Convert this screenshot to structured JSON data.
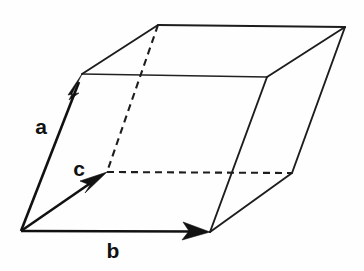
{
  "figure": {
    "title": "Crystallographic unit cell parallelepiped",
    "background_color": "#fefefe",
    "line_color": "#1d1d1d",
    "vector_color": "#111111",
    "canvas": {
      "width": 364,
      "height": 271
    }
  },
  "vectors": [
    {
      "id": "a",
      "label": "a",
      "label_x": 41,
      "label_y": 128,
      "from": {
        "x": 21,
        "y": 231
      },
      "to": {
        "x": 82,
        "y": 74
      },
      "style": "solid-arrow",
      "description": "lattice vector a, up and slightly right"
    },
    {
      "id": "b",
      "label": "b",
      "label_x": 113,
      "label_y": 252,
      "from": {
        "x": 21,
        "y": 231
      },
      "to": {
        "x": 210,
        "y": 232
      },
      "style": "solid-arrow",
      "description": "lattice vector b, horizontal to the right"
    },
    {
      "id": "c",
      "label": "c",
      "label_x": 79,
      "label_y": 170,
      "from": {
        "x": 21,
        "y": 231
      },
      "to": {
        "x": 107,
        "y": 172
      },
      "style": "solid-arrow",
      "description": "lattice vector c, up-right into the page toward the hidden rear vertex"
    }
  ],
  "vertices": {
    "origin": {
      "x": 21,
      "y": 231,
      "name": "front-bottom-left"
    },
    "front_top_left": {
      "x": 82,
      "y": 74,
      "name": "front-top-left"
    },
    "front_top_right": {
      "x": 267,
      "y": 77,
      "name": "front-top-right"
    },
    "front_bottom_right": {
      "x": 210,
      "y": 232,
      "name": "front-bottom-right"
    },
    "back_top_left": {
      "x": 158,
      "y": 25,
      "name": "back-top-left apex"
    },
    "back_top_right": {
      "x": 345,
      "y": 27,
      "name": "back-top-right"
    },
    "back_bottom_right": {
      "x": 292,
      "y": 173,
      "name": "back-bottom-right"
    },
    "back_bottom_left": {
      "x": 107,
      "y": 172,
      "name": "back-bottom-left (hidden)"
    }
  },
  "edges": {
    "solid": [
      {
        "name": "front-top-edge",
        "from": "front_top_left",
        "to": "front_top_right"
      },
      {
        "name": "top-back-edge",
        "from": "back_top_left",
        "to": "back_top_right"
      },
      {
        "name": "top-left-slant",
        "from": "front_top_left",
        "to": "back_top_left"
      },
      {
        "name": "top-right-slant",
        "from": "front_top_right",
        "to": "back_top_right"
      },
      {
        "name": "right-front-vertical",
        "from": "front_top_right",
        "to": "front_bottom_right"
      },
      {
        "name": "right-back-vertical",
        "from": "back_top_right",
        "to": "back_bottom_right"
      },
      {
        "name": "bottom-right-slant",
        "from": "front_bottom_right",
        "to": "back_bottom_right"
      },
      {
        "name": "left-front-vertical",
        "from": "origin",
        "to": "front_top_left"
      },
      {
        "name": "bottom-front-edge",
        "from": "origin",
        "to": "front_bottom_right"
      }
    ],
    "hidden": [
      {
        "name": "back-left-vertical-dashed",
        "from": "back_top_left",
        "to": "back_bottom_left"
      },
      {
        "name": "back-bottom-edge-dashed",
        "from": "back_bottom_left",
        "to": "back_bottom_right"
      }
    ]
  }
}
